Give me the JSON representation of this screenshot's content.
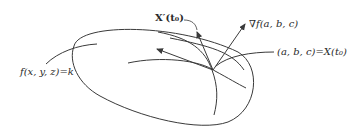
{
  "diagram": {
    "type": "level-surface-gradient",
    "labels": {
      "surface": "f(x, y, z)=k",
      "tangent": "X′(t₀)",
      "gradient": "∇f(a, b, c)",
      "point": "(a, b, c)=X(t₀)"
    },
    "colors": {
      "stroke": "#3a3a3a",
      "text": "#2a2a2a",
      "background": "#ffffff"
    }
  }
}
